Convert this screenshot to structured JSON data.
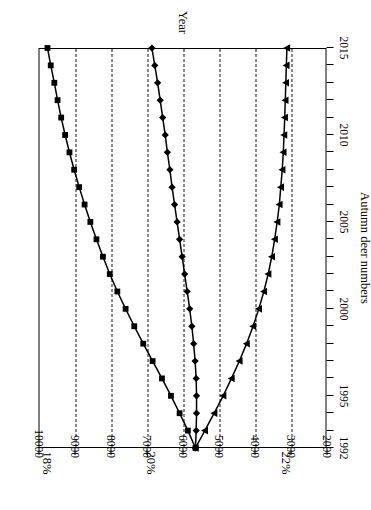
{
  "chart_data": {
    "type": "line",
    "title": "",
    "xlabel": "Year",
    "ylabel": "Autumn deer numbers",
    "xlim": [
      1992,
      2015
    ],
    "ylim": [
      2000,
      10000
    ],
    "x_ticks": [
      1992,
      1995,
      2000,
      2005,
      2010,
      2015
    ],
    "x_minor_step": 1,
    "y_ticks": [
      2000,
      3000,
      4000,
      5000,
      6000,
      7000,
      8000,
      9000,
      10000
    ],
    "grid": "horizontal-dashed-on-value-axis",
    "legend": "inline-annotations-above-plot",
    "annotations": [
      {
        "label": "18%",
        "value": 9750
      },
      {
        "label": "20%",
        "value": 6850
      },
      {
        "label": "22%",
        "value": 3100
      }
    ],
    "x": [
      1992,
      1993,
      1994,
      1995,
      1996,
      1997,
      1998,
      1999,
      2000,
      2001,
      2002,
      2003,
      2004,
      2005,
      2006,
      2007,
      2008,
      2009,
      2010,
      2011,
      2012,
      2013,
      2014,
      2015
    ],
    "series": [
      {
        "name": "18%",
        "marker": "square",
        "values": [
          5640,
          5850,
          6080,
          6320,
          6570,
          6830,
          7090,
          7340,
          7580,
          7810,
          8020,
          8210,
          8390,
          8560,
          8720,
          8870,
          9010,
          9140,
          9260,
          9370,
          9470,
          9560,
          9660,
          9750
        ]
      },
      {
        "name": "20%",
        "marker": "diamond",
        "values": [
          5640,
          5620,
          5610,
          5610,
          5620,
          5650,
          5690,
          5740,
          5800,
          5870,
          5940,
          6010,
          6080,
          6150,
          6220,
          6290,
          6350,
          6420,
          6480,
          6550,
          6620,
          6690,
          6770,
          6850
        ]
      },
      {
        "name": "22%",
        "marker": "triangle",
        "values": [
          5640,
          5380,
          5120,
          4870,
          4640,
          4420,
          4220,
          4040,
          3880,
          3740,
          3620,
          3520,
          3440,
          3370,
          3310,
          3270,
          3230,
          3200,
          3180,
          3160,
          3145,
          3130,
          3115,
          3100
        ]
      }
    ]
  },
  "axis": {
    "y_title": "Autumn deer numbers",
    "x_title": "Year"
  }
}
